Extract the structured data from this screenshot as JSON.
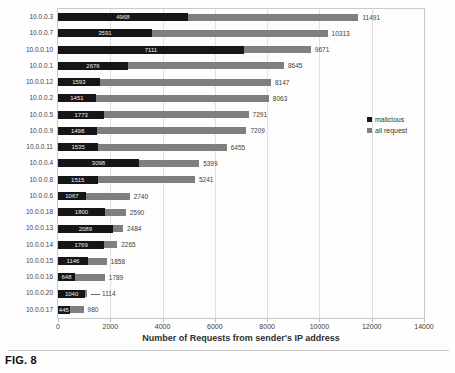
{
  "figure_label": "FIG. 8",
  "colors": {
    "malicious_bar": "#161616",
    "all_request_bar": "#7f7f7f",
    "gridline": "#e0e0e0",
    "axis_text": "#3d3d3d"
  },
  "chart_data": {
    "type": "bar",
    "orientation": "horizontal",
    "title": "",
    "xlabel": "Number of Requests from sender's IP address",
    "ylabel": "",
    "xlim": [
      0,
      14000
    ],
    "x_ticks": [
      0,
      2000,
      4000,
      6000,
      8000,
      10000,
      12000,
      14000
    ],
    "grid": true,
    "legend_position": "right",
    "categories": [
      "10.0.0.3",
      "10.0.0.7",
      "10.0.0.10",
      "10.0.0.1",
      "10.0.0.12",
      "10.0.0.2",
      "10.0.0.5",
      "10.0.0.9",
      "10.0.0.11",
      "10.0.0.4",
      "10.0.0.8",
      "10.0.0.6",
      "10.0.0.18",
      "10.0.0.13",
      "10.0.0.14",
      "10.0.0.15",
      "10.0.0.16",
      "10.0.0.20",
      "10.0.0.17"
    ],
    "series": [
      {
        "name": "malicious",
        "color": "#161616",
        "values": [
          4968,
          3591,
          7111,
          2676,
          1593,
          1451,
          1773,
          1498,
          1535,
          3098,
          1515,
          1067,
          1800,
          2089,
          1769,
          1146,
          648,
          1040,
          445
        ]
      },
      {
        "name": "all request",
        "color": "#7f7f7f",
        "values": [
          11491,
          10313,
          9671,
          8645,
          8147,
          8063,
          7291,
          7209,
          6455,
          5399,
          5241,
          2740,
          2590,
          2484,
          2265,
          1858,
          1789,
          1114,
          980
        ]
      }
    ],
    "label_leader_rows": [
      "10.0.0.20"
    ]
  }
}
